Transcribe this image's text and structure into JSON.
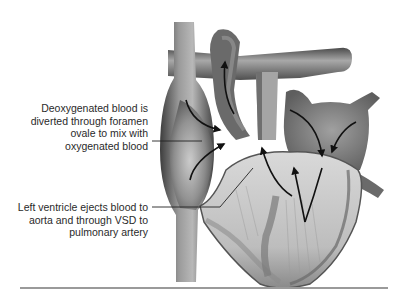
{
  "diagram": {
    "labels": [
      {
        "id": "foramen-ovale",
        "lines": [
          "Deoxygenated blood is",
          "diverted through foramen",
          "ovale to mix with",
          "oxygenated blood"
        ]
      },
      {
        "id": "left-ventricle",
        "lines": [
          "Left ventricle ejects blood to",
          "aorta and through VSD to",
          "pulmonary artery"
        ]
      }
    ],
    "colors": {
      "tissue_dark": "#4a4a4a",
      "tissue_mid": "#8a8a8a",
      "tissue_light": "#d6d6d6",
      "arrow": "#111111",
      "text": "#2a2a2a",
      "divider": "#9a9a9a"
    }
  }
}
